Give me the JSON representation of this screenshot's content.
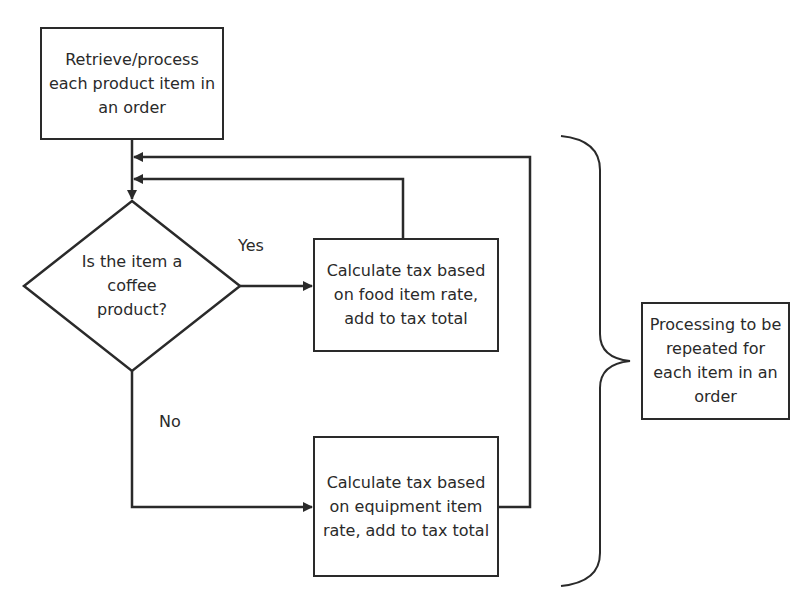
{
  "diagram": {
    "type": "flowchart",
    "nodes": {
      "start": {
        "shape": "rectangle",
        "text": "Retrieve/process each product item in an order"
      },
      "decision": {
        "shape": "diamond",
        "text": "Is the item a coffee product?"
      },
      "food_tax": {
        "shape": "rectangle",
        "text": "Calculate tax based on food item rate, add to tax total"
      },
      "equipment_tax": {
        "shape": "rectangle",
        "text": "Calculate tax based on equipment item rate, add to tax total"
      },
      "note": {
        "shape": "rectangle",
        "text": "Processing to be repeated for each item in an order"
      }
    },
    "edge_labels": {
      "yes": "Yes",
      "no": "No"
    },
    "edges": [
      {
        "from": "start",
        "to": "decision",
        "label": ""
      },
      {
        "from": "decision",
        "to": "food_tax",
        "label": "Yes"
      },
      {
        "from": "decision",
        "to": "equipment_tax",
        "label": "No"
      },
      {
        "from": "food_tax",
        "to": "decision",
        "label": "loop back"
      },
      {
        "from": "equipment_tax",
        "to": "decision",
        "label": "loop back"
      }
    ],
    "annotation": {
      "shape": "curly-brace",
      "target": "note"
    },
    "colors": {
      "stroke": "#2a2a2a",
      "fill": "#ffffff",
      "text": "#2a2a2a"
    }
  }
}
